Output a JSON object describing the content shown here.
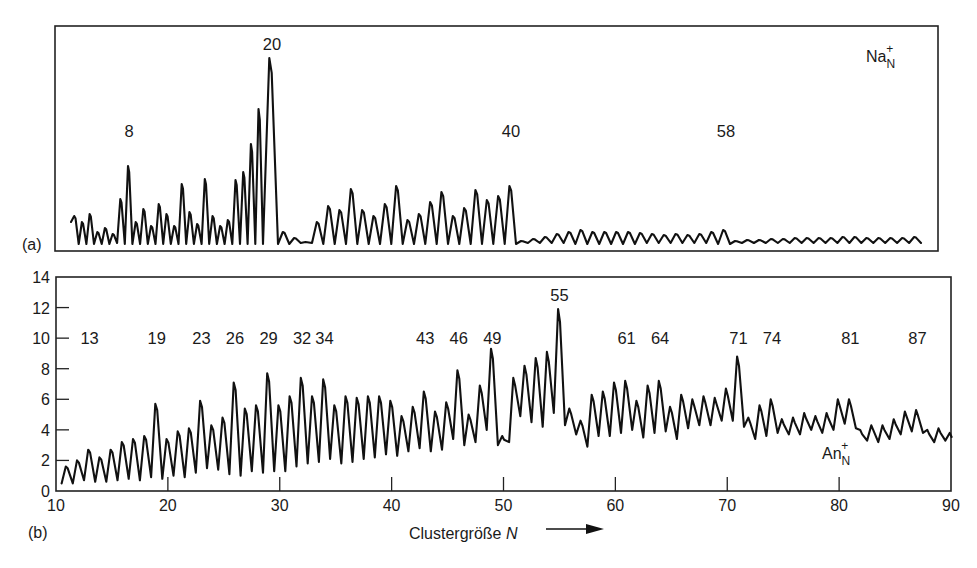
{
  "figure": {
    "panel_a_tag": "(a)",
    "panel_b_tag": "(b)",
    "xlabel_text": "Clustergröße ",
    "xlabel_var": "N",
    "arrow": "→"
  },
  "chart_data": [
    {
      "panel": "a",
      "type": "line",
      "title": "",
      "species": {
        "base": "Na",
        "sub": "N",
        "sup": "+"
      },
      "xlabel": "",
      "ylabel": "",
      "y_axis_shown": false,
      "grid": false,
      "annotations": [
        {
          "label": "8",
          "x_px": 129,
          "y_px": 137
        },
        {
          "label": "20",
          "x_px": 272,
          "y_px": 50
        },
        {
          "label": "40",
          "x_px": 511,
          "y_px": 137
        },
        {
          "label": "58",
          "x_px": 726,
          "y_px": 137
        }
      ],
      "description": "Na_N+ mass spectrum: strong magic-number peak at N=20, secondary at N=8 and N=40, tiny oscillations beyond 40 with a weak bump at 58",
      "peaks_px": {
        "x_start": 71,
        "x_end": 921,
        "baseline_y": 244,
        "segments": [
          {
            "from": 71,
            "to": 263,
            "heights": [
              28,
              22,
              30,
              12,
              16,
              10,
              45,
              78,
              22,
              35,
              18,
              40,
              30,
              18,
              60,
              32,
              20,
              65,
              28,
              18,
              24,
              64,
              72,
              100,
              135
            ]
          },
          {
            "from": 263,
            "to": 278,
            "heights": [
              186
            ]
          },
          {
            "from": 278,
            "to": 516,
            "heights": [
              12,
              6,
              2,
              22,
              38,
              34,
              55,
              34,
              28,
              40,
              58,
              24,
              30,
              42,
              52,
              28,
              36,
              54,
              44,
              48,
              58
            ]
          },
          {
            "from": 516,
            "to": 730,
            "heights": [
              3,
              5,
              7,
              10,
              12,
              14,
              12,
              12,
              12,
              12,
              11,
              10,
              9,
              10,
              9,
              10,
              12,
              14
            ]
          },
          {
            "from": 730,
            "to": 921,
            "heights": [
              3,
              4,
              4,
              5,
              5,
              6,
              6,
              6,
              6,
              7,
              7,
              6,
              6,
              6,
              6,
              7
            ]
          }
        ]
      }
    },
    {
      "panel": "b",
      "type": "line",
      "title": "",
      "species": {
        "base": "An",
        "sub": "N",
        "sup": "+"
      },
      "xlabel": "Clustergröße N",
      "ylabel": "",
      "xlim": [
        10,
        90
      ],
      "ylim": [
        0,
        14
      ],
      "x_ticks": [
        10,
        20,
        30,
        40,
        50,
        60,
        70,
        80,
        90
      ],
      "y_ticks": [
        0,
        2,
        4,
        6,
        8,
        10,
        12,
        14
      ],
      "grid": false,
      "magic_numbers": [
        13,
        19,
        23,
        26,
        29,
        32,
        34,
        43,
        46,
        49,
        55,
        61,
        64,
        71,
        74,
        81,
        87
      ],
      "magic_label_y": {
        "default": 10.0,
        "55": 12.8
      },
      "x": [
        11,
        12,
        13,
        14,
        15,
        16,
        17,
        18,
        19,
        20,
        21,
        22,
        23,
        24,
        25,
        26,
        27,
        28,
        29,
        30,
        31,
        32,
        33,
        34,
        35,
        36,
        37,
        38,
        39,
        40,
        41,
        42,
        43,
        44,
        45,
        46,
        47,
        48,
        49,
        50,
        51,
        52,
        53,
        54,
        55,
        56,
        57,
        58,
        59,
        60,
        61,
        62,
        63,
        64,
        65,
        66,
        67,
        68,
        69,
        70,
        71,
        72,
        73,
        74,
        75,
        76,
        77,
        78,
        79,
        80,
        81,
        82,
        83,
        84,
        85,
        86,
        87,
        88,
        89,
        90
      ],
      "peaks": [
        1.6,
        2.0,
        2.7,
        2.2,
        2.7,
        3.2,
        3.4,
        3.6,
        5.7,
        3.4,
        3.9,
        4.1,
        5.9,
        4.3,
        4.8,
        7.1,
        5.4,
        5.6,
        7.7,
        5.6,
        6.2,
        7.4,
        6.2,
        7.3,
        5.6,
        6.2,
        6.1,
        6.2,
        6.2,
        5.9,
        4.9,
        5.5,
        6.5,
        5.2,
        5.8,
        7.9,
        5.0,
        6.9,
        9.3,
        3.6,
        7.4,
        8.2,
        8.7,
        9.1,
        11.9,
        5.4,
        4.6,
        6.3,
        6.5,
        7.1,
        7.2,
        5.9,
        6.9,
        7.2,
        5.5,
        6.3,
        6.0,
        6.2,
        6.1,
        6.7,
        8.8,
        4.8,
        5.6,
        6.0,
        4.7,
        4.8,
        5.1,
        4.9,
        5.1,
        6.0,
        6.0,
        4.0,
        4.3,
        4.3,
        4.7,
        5.2,
        5.3,
        4.0,
        4.1,
        3.8
      ],
      "valleys": [
        0.5,
        0.7,
        0.6,
        0.6,
        0.7,
        0.8,
        0.7,
        0.9,
        0.8,
        1.0,
        0.9,
        1.2,
        1.5,
        1.4,
        1.1,
        1.0,
        1.3,
        1.2,
        1.3,
        1.3,
        1.6,
        1.8,
        1.9,
        2.1,
        1.8,
        1.9,
        2.1,
        2.2,
        2.4,
        2.3,
        2.6,
        2.8,
        2.6,
        2.7,
        3.4,
        3.0,
        3.2,
        4.0,
        3.0,
        3.2,
        4.9,
        4.5,
        4.2,
        5.1,
        4.3,
        3.7,
        2.9,
        3.6,
        3.6,
        3.8,
        4.0,
        3.5,
        3.8,
        3.9,
        3.4,
        4.1,
        4.3,
        4.3,
        4.6,
        4.6,
        4.2,
        3.4,
        3.6,
        3.8,
        3.7,
        3.7,
        4.0,
        3.8,
        4.0,
        4.4,
        4.1,
        3.3,
        3.2,
        3.4,
        3.7,
        3.9,
        3.8,
        3.2,
        3.3,
        3.5
      ]
    }
  ]
}
